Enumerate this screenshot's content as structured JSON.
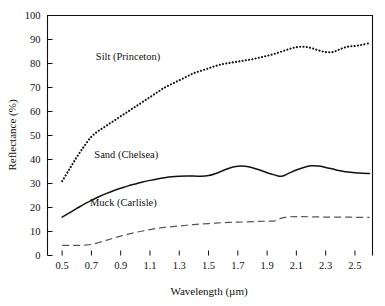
{
  "chart_data": {
    "type": "line",
    "title": "",
    "xlabel": "Wavelength (µm)",
    "ylabel": "Reflectance (%)",
    "xlim": [
      0.4,
      2.62
    ],
    "ylim": [
      0,
      100
    ],
    "grid": false,
    "legend_position": "inline-annotations",
    "xticks": [
      0.5,
      0.7,
      0.9,
      1.1,
      1.3,
      1.5,
      1.7,
      1.9,
      2.1,
      2.3,
      2.5
    ],
    "xtick_labels": [
      "0.5",
      "0.7",
      "0.9",
      "1.1",
      "1.3",
      "1.5",
      "1.7",
      "1.9",
      "2.1",
      "2.3",
      "2.5"
    ],
    "yticks": [
      0,
      10,
      20,
      30,
      40,
      50,
      60,
      70,
      80,
      90,
      100
    ],
    "ytick_labels": [
      "0",
      "10",
      "20",
      "30",
      "40",
      "50",
      "60",
      "70",
      "80",
      "90",
      "100"
    ],
    "x": [
      0.5,
      0.55,
      0.6,
      0.65,
      0.7,
      0.75,
      0.8,
      0.85,
      0.9,
      0.95,
      1.0,
      1.05,
      1.1,
      1.15,
      1.2,
      1.25,
      1.3,
      1.35,
      1.4,
      1.45,
      1.5,
      1.55,
      1.6,
      1.65,
      1.7,
      1.75,
      1.8,
      1.85,
      1.9,
      1.95,
      2.0,
      2.05,
      2.1,
      2.15,
      2.2,
      2.25,
      2.3,
      2.35,
      2.4,
      2.45,
      2.5,
      2.55,
      2.6
    ],
    "series": [
      {
        "name": "Silt (Princeton)",
        "style": "dotted",
        "color": "#111111",
        "values": [
          31.0,
          36.0,
          41.0,
          45.5,
          49.5,
          52.0,
          54.0,
          56.0,
          58.0,
          60.0,
          62.0,
          64.0,
          66.0,
          68.0,
          70.0,
          71.5,
          73.0,
          74.5,
          76.0,
          77.0,
          78.0,
          79.0,
          79.8,
          80.3,
          80.8,
          81.3,
          81.8,
          82.5,
          83.2,
          84.0,
          85.0,
          86.0,
          86.8,
          87.0,
          86.5,
          85.5,
          84.8,
          84.8,
          86.0,
          87.0,
          87.3,
          87.8,
          88.5
        ]
      },
      {
        "name": "Sand (Chelsea)",
        "style": "solid",
        "color": "#111111",
        "values": [
          16.0,
          17.8,
          19.6,
          21.4,
          23.0,
          24.5,
          25.8,
          27.0,
          28.0,
          29.0,
          29.8,
          30.6,
          31.3,
          31.9,
          32.4,
          32.8,
          33.0,
          33.1,
          33.1,
          33.0,
          33.3,
          34.2,
          35.4,
          36.6,
          37.2,
          37.2,
          36.6,
          35.6,
          34.5,
          33.6,
          33.0,
          34.3,
          35.6,
          36.7,
          37.4,
          37.3,
          36.7,
          36.0,
          35.3,
          34.8,
          34.5,
          34.3,
          34.2
        ]
      },
      {
        "name": "Muck (Carlisle)",
        "style": "dashed",
        "color": "#555555",
        "values": [
          4.2,
          4.2,
          4.2,
          4.3,
          4.6,
          5.4,
          6.3,
          7.2,
          8.1,
          8.9,
          9.6,
          10.2,
          10.8,
          11.3,
          11.7,
          12.0,
          12.3,
          12.6,
          12.9,
          13.1,
          13.3,
          13.5,
          13.7,
          13.8,
          13.9,
          14.0,
          14.1,
          14.2,
          14.3,
          14.4,
          15.6,
          16.1,
          16.2,
          16.2,
          16.1,
          16.1,
          16.0,
          16.0,
          16.0,
          16.0,
          15.9,
          15.9,
          15.9
        ]
      }
    ],
    "annotations": [
      {
        "text": "Silt  (Princeton)",
        "x": 0.73,
        "y": 81.5
      },
      {
        "text": "Sand  (Chelsea)",
        "x": 0.72,
        "y": 40.5
      },
      {
        "text": "Muck  (Carlisle)",
        "x": 0.69,
        "y": 20.5
      }
    ]
  }
}
